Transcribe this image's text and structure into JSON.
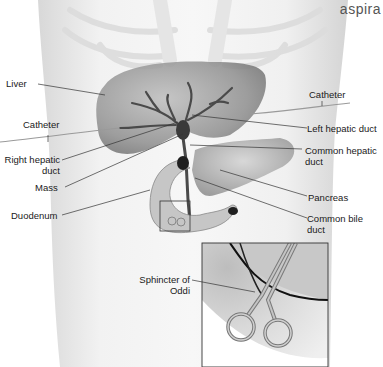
{
  "corner_text": "aspira",
  "labels": {
    "liver": "Liver",
    "catheter_left": "Catheter",
    "catheter_right": "Catheter",
    "right_hepatic_duct_1": "Right hepatic",
    "right_hepatic_duct_2": "duct",
    "mass": "Mass",
    "duodenum": "Duodenum",
    "left_hepatic_duct": "Left hepatic duct",
    "common_hepatic_duct_1": "Common hepatic",
    "common_hepatic_duct_2": "duct",
    "pancreas": "Pancreas",
    "common_bile_duct_1": "Common bile",
    "common_bile_duct_2": "duct",
    "sphincter_1": "Sphincter of",
    "sphincter_2": "Oddi"
  },
  "colors": {
    "background": "#ffffff",
    "torso": "#e8e8e8",
    "organ": "#9a9a9a",
    "line": "#333333",
    "text": "#1a1a1a"
  }
}
